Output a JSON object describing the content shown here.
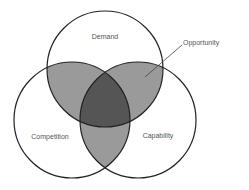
{
  "diagram": {
    "type": "venn",
    "circles": [
      {
        "id": "demand",
        "label": "Demand"
      },
      {
        "id": "competition",
        "label": "Competition"
      },
      {
        "id": "capability",
        "label": "Capability"
      }
    ],
    "callout": {
      "label": "Opportunity"
    },
    "colors": {
      "pair_overlap": "#9a9a9a",
      "triple_overlap": "#555555",
      "stroke": "#222222",
      "text": "#555555"
    }
  }
}
